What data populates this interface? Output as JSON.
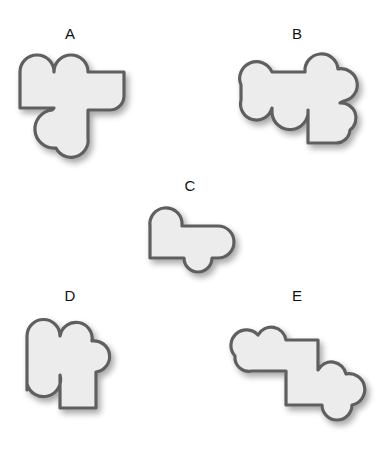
{
  "options": [
    {
      "label": "A"
    },
    {
      "label": "B"
    },
    {
      "label": "C"
    },
    {
      "label": "D"
    },
    {
      "label": "E"
    }
  ],
  "colors": {
    "fill": "#ececec",
    "stroke": "#5f5f5f",
    "text": "#111111",
    "background": "#ffffff"
  }
}
